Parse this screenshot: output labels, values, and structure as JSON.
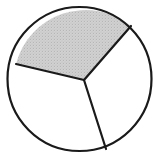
{
  "figure": {
    "type": "geometric-diagram",
    "shape": "circle",
    "background_color": "#ffffff",
    "stroke_color": "#1a1a1a",
    "stroke_width": 2.2,
    "circle": {
      "center_x": 79.5,
      "center_y": 79.0,
      "radius": 72.0,
      "fill_color": "#ffffff"
    },
    "vertex": {
      "label": "sector-junction-point",
      "x": 84.0,
      "y": 80.0
    },
    "radii": [
      {
        "name": "radius-left",
        "end_x": 16.0,
        "end_y": 64.0,
        "angle_degrees": 194
      },
      {
        "name": "radius-upper-right",
        "end_x": 131.0,
        "end_y": 26.0,
        "angle_degrees": 49
      },
      {
        "name": "radius-bottom",
        "end_x": 106.0,
        "end_y": 149.0,
        "angle_degrees": 288
      }
    ],
    "sectors": [
      {
        "name": "sector-top-shaded",
        "position": "top",
        "shaded": true,
        "fill_color": "#cfcfcf",
        "pattern": "stipple-dots",
        "fraction_label": "1/3"
      },
      {
        "name": "sector-lower-left",
        "position": "lower-left",
        "shaded": false,
        "fill_color": "#ffffff",
        "pattern": "none",
        "fraction_label": "1/3"
      },
      {
        "name": "sector-right",
        "position": "right",
        "shaded": false,
        "fill_color": "#ffffff",
        "pattern": "none",
        "fraction_label": "1/3"
      }
    ],
    "shaded_count": 1,
    "total_count": 3,
    "caption": ""
  }
}
